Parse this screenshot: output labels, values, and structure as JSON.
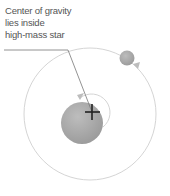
{
  "diagram": {
    "label_lines": [
      "Center of gravity",
      "lies inside",
      "high-mass star"
    ],
    "elements": {
      "large_star": {
        "name": "high-mass star",
        "cx": 82,
        "cy": 123,
        "r": 21,
        "color": "#a8a8a8"
      },
      "small_star": {
        "name": "low-mass star",
        "cx": 127,
        "cy": 58,
        "r": 7.5,
        "color": "#b0b0b0"
      },
      "center_of_gravity": {
        "x": 92,
        "y": 112
      },
      "outer_orbit": {
        "cx": 90,
        "cy": 114,
        "r": 66,
        "color": "#cccccc"
      },
      "inner_orbit": {
        "cx": 92,
        "cy": 112,
        "r": 18,
        "color": "#cccccc"
      }
    }
  }
}
